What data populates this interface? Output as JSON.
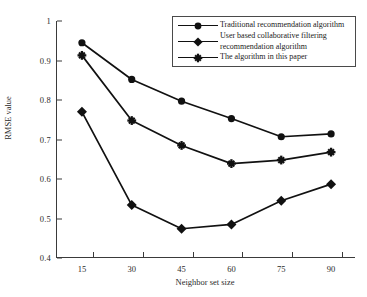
{
  "chart_data": {
    "type": "line",
    "title": "",
    "xlabel": "Neighbor set size",
    "ylabel": "RMSE value",
    "categories": [
      15,
      30,
      45,
      60,
      75,
      90
    ],
    "x": [
      15,
      30,
      45,
      60,
      75,
      90
    ],
    "xlim": [
      7.5,
      97.5
    ],
    "ylim": [
      0.4,
      1
    ],
    "yticks": [
      "1",
      "0.9",
      "0.8",
      "0.7",
      "0.6",
      "0.5",
      "0.4"
    ],
    "ytick_values": [
      1,
      0.9,
      0.8,
      0.7,
      0.6,
      0.5,
      0.4
    ],
    "xticks": [
      "15",
      "30",
      "45",
      "60",
      "75",
      "90"
    ],
    "grid": false,
    "legend_position": "top-right",
    "series": [
      {
        "name": "Traditional recommendation algorithm",
        "marker": "circle",
        "color": "#111111",
        "values": [
          0.945,
          0.852,
          0.797,
          0.753,
          0.707,
          0.714
        ]
      },
      {
        "name": "User based collaborative filtering\nrecommendation algorithm",
        "marker": "diamond",
        "color": "#111111",
        "values": [
          0.77,
          0.534,
          0.474,
          0.485,
          0.545,
          0.587
        ]
      },
      {
        "name": "The algorithm in this paper",
        "marker": "star",
        "color": "#111111",
        "values": [
          0.913,
          0.748,
          0.685,
          0.639,
          0.648,
          0.668
        ]
      }
    ]
  },
  "legend": {
    "items": [
      {
        "label": "Traditional recommendation algorithm",
        "marker": "circle"
      },
      {
        "label": "User based collaborative filtering\n   recommendation algorithm",
        "marker": "diamond"
      },
      {
        "label": "The algorithm in this paper",
        "marker": "star"
      }
    ]
  },
  "axes": {
    "y_title": "RMSE value",
    "x_title": "Neighbor set size",
    "y_tick_labels": [
      "1",
      "0.9",
      "0.8",
      "0.7",
      "0.6",
      "0.5",
      "0.4"
    ],
    "x_tick_labels": [
      "15",
      "30",
      "45",
      "60",
      "75",
      "90"
    ]
  },
  "colors": {
    "ink": "#111111",
    "axis": "#3a3a3a",
    "background": "#ffffff"
  }
}
